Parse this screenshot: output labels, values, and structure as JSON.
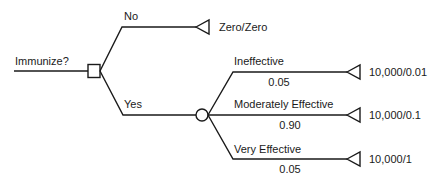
{
  "diagram": {
    "type": "decision-tree",
    "root": {
      "label": "Immunize?",
      "node_type": "decision",
      "node_shape": "square"
    },
    "branches": [
      {
        "label": "No",
        "outcome": "Zero/Zero",
        "node_shape": "triangle"
      },
      {
        "label": "Yes",
        "node_type": "chance",
        "node_shape": "circle",
        "children": [
          {
            "label": "Ineffective",
            "probability": "0.05",
            "outcome": "10,000/0.01",
            "node_shape": "triangle"
          },
          {
            "label": "Moderately Effective",
            "probability": "0.90",
            "outcome": "10,000/0.1",
            "node_shape": "triangle"
          },
          {
            "label": "Very Effective",
            "probability": "0.05",
            "outcome": "10,000/1",
            "node_shape": "triangle"
          }
        ]
      }
    ]
  },
  "colors": {
    "line": "#1a1a1a",
    "background": "#ffffff"
  }
}
